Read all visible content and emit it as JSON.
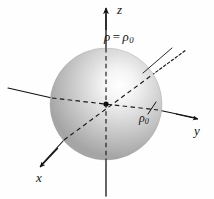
{
  "figure": {
    "name": "sphere-rho-equals-rho-zero",
    "background_color": "#fefefe",
    "ink_color": "#111111"
  },
  "labels": {
    "equation": {
      "rho": "ρ",
      "operator": "=",
      "rho_sub": "ρ",
      "subscript": "0",
      "full_text": "ρ = ρ₀"
    },
    "radius_marker": {
      "rho": "ρ",
      "subscript": "0",
      "full_text": "ρ₀"
    },
    "axis_z": "z",
    "axis_y": "y",
    "axis_x": "x"
  },
  "sphere": {
    "center_x": 106,
    "center_y": 104,
    "radius": 56,
    "highlight_x": 128,
    "highlight_y": 78,
    "highlight_color": "#ffffff",
    "mid_color": "#c9c9c9",
    "edge_color": "#8f8f8f",
    "rim_color": "#a8a8a8"
  },
  "axes": {
    "z": {
      "label": "z",
      "arrow": "up",
      "solid": true
    },
    "y": {
      "label": "y",
      "arrow": "right",
      "solid": true
    },
    "x": {
      "label": "x",
      "arrow": "down-left",
      "solid": true
    },
    "hidden_style": "dashed"
  },
  "annotations": {
    "leader_line": "from equation label down-left to sphere surface",
    "tick_mark": "short tick crossing the positive y-axis at the sphere surface",
    "origin_dot": "filled dot at the coordinate origin"
  }
}
